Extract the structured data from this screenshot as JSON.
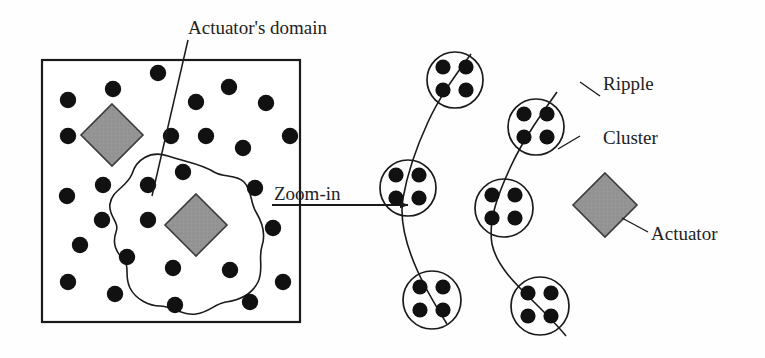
{
  "figure": {
    "labels": {
      "actuators_domain": "Actuator's domain",
      "zoom_in": "Zoom-in",
      "ripple": "Ripple",
      "cluster": "Cluster",
      "actuator": "Actuator"
    },
    "colors": {
      "node_fill": "#111111",
      "actuator_fill": "#9a9a9a",
      "actuator_stroke": "#3a3a3a",
      "line_stroke": "#1a1a1a",
      "background": "#ffffff"
    }
  },
  "left_panel": {
    "name": "sensor-field-overview",
    "boundary": {
      "x": 42,
      "y": 60,
      "width": 258,
      "height": 262
    },
    "actuator": {
      "cx": 112,
      "cy": 135,
      "half": 31
    },
    "domain_actuator": {
      "cx": 196,
      "cy": 225,
      "half": 31
    },
    "nodes": [
      {
        "cx": 68,
        "cy": 100
      },
      {
        "cx": 113,
        "cy": 89
      },
      {
        "cx": 158,
        "cy": 73
      },
      {
        "cx": 229,
        "cy": 87
      },
      {
        "cx": 196,
        "cy": 102
      },
      {
        "cx": 266,
        "cy": 103
      },
      {
        "cx": 68,
        "cy": 136
      },
      {
        "cx": 171,
        "cy": 136
      },
      {
        "cx": 206,
        "cy": 136
      },
      {
        "cx": 290,
        "cy": 136
      },
      {
        "cx": 243,
        "cy": 148
      },
      {
        "cx": 183,
        "cy": 172
      },
      {
        "cx": 67,
        "cy": 196
      },
      {
        "cx": 103,
        "cy": 185
      },
      {
        "cx": 148,
        "cy": 185
      },
      {
        "cx": 255,
        "cy": 188
      },
      {
        "cx": 102,
        "cy": 220
      },
      {
        "cx": 148,
        "cy": 220
      },
      {
        "cx": 273,
        "cy": 228
      },
      {
        "cx": 80,
        "cy": 245
      },
      {
        "cx": 127,
        "cy": 257
      },
      {
        "cx": 173,
        "cy": 268
      },
      {
        "cx": 230,
        "cy": 270
      },
      {
        "cx": 68,
        "cy": 282
      },
      {
        "cx": 115,
        "cy": 294
      },
      {
        "cx": 250,
        "cy": 302
      },
      {
        "cx": 175,
        "cy": 305
      },
      {
        "cx": 283,
        "cy": 282
      }
    ],
    "domain_outline": "M 168 156 C 150 150, 136 160, 132 174 C 126 188, 112 190, 110 204 C 108 216, 120 222, 116 232 C 112 244, 116 252, 124 260 C 130 266, 124 276, 130 288 C 136 300, 150 306, 160 306 C 172 306, 182 316, 196 314 C 210 312, 214 304, 226 302 C 240 300, 252 294, 258 282 C 264 270, 258 258, 262 246 C 266 234, 262 222, 256 212 C 250 202, 252 190, 244 182 C 236 174, 224 178, 214 172 C 202 164, 186 162, 168 156 Z",
    "pointer_line": {
      "x1": 188,
      "y1": 40,
      "x2": 152,
      "y2": 196
    },
    "zoom_arrow": {
      "x1": 272,
      "y1": 205,
      "x2": 408,
      "y2": 205
    }
  },
  "right_panel": {
    "name": "cluster-zoom-detail",
    "clusters": [
      {
        "cx": 455,
        "cy": 80,
        "r": 28
      },
      {
        "cx": 408,
        "cy": 188,
        "r": 28
      },
      {
        "cx": 432,
        "cy": 300,
        "r": 29
      },
      {
        "cx": 536,
        "cy": 127,
        "r": 28
      },
      {
        "cx": 504,
        "cy": 208,
        "r": 29
      },
      {
        "cx": 540,
        "cy": 306,
        "r": 29
      }
    ],
    "cluster_node_offsets": [
      {
        "dx": -12,
        "dy": -13
      },
      {
        "dx": 11,
        "dy": -13
      },
      {
        "dx": -12,
        "dy": 10
      },
      {
        "dx": 11,
        "dy": 10
      }
    ],
    "ripples": [
      "M 471 54 C 455 76, 440 96, 428 122 C 416 148, 408 170, 403 198 C 399 222, 408 250, 418 272 C 427 292, 437 308, 447 324",
      "M 557 92 C 540 116, 523 140, 511 166 C 498 194, 488 220, 492 244 C 497 268, 520 288, 536 304 C 549 317, 558 326, 566 336"
    ],
    "actuator": {
      "cx": 605,
      "cy": 205,
      "half": 32
    },
    "leaders": {
      "ripple": {
        "x1": 580,
        "y1": 82,
        "x2": 600,
        "y2": 96
      },
      "cluster": {
        "x1": 580,
        "y1": 136,
        "x2": 558,
        "y2": 149
      },
      "actuator": {
        "x1": 648,
        "y1": 232,
        "x2": 622,
        "y2": 218
      }
    }
  }
}
